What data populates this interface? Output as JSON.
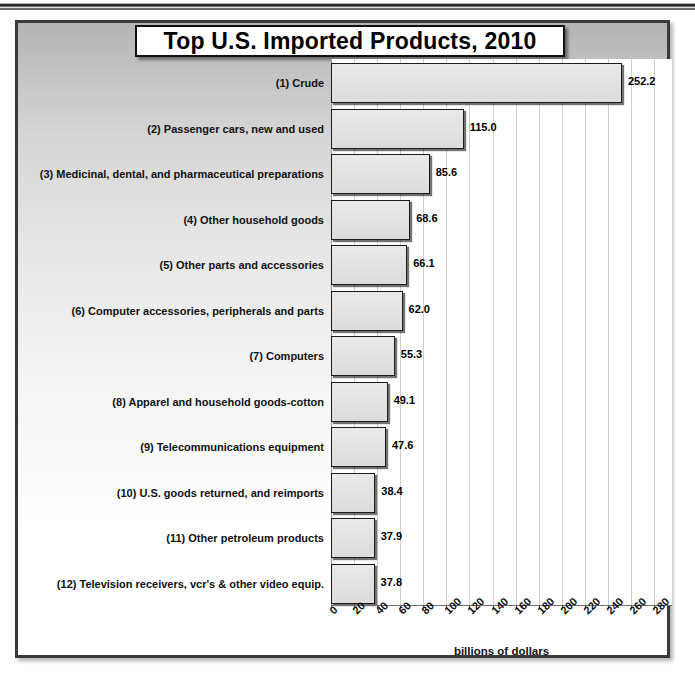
{
  "decor": {
    "top_rule_name": "page-header-rule"
  },
  "chart_data": {
    "type": "bar",
    "orientation": "horizontal",
    "title": "Top U.S. Imported Products, 2010",
    "xlabel": "billions of dollars",
    "ylabel": "",
    "xlim": [
      0,
      280
    ],
    "xticks": [
      0,
      20,
      40,
      60,
      80,
      100,
      120,
      140,
      160,
      180,
      200,
      220,
      240,
      260,
      280
    ],
    "xtick_labels": [
      "0",
      "20",
      "40",
      "60",
      "80",
      "100",
      "120",
      "140",
      "160",
      "180",
      "200",
      "220",
      "240",
      "260",
      "280"
    ],
    "grid": "vertical",
    "legend": "none",
    "categories": [
      "(1) Crude",
      "(2) Passenger cars, new and used",
      "(3) Medicinal, dental, and pharmaceutical preparations",
      "(4) Other household goods",
      "(5) Other parts and accessories",
      "(6) Computer accessories, peripherals and parts",
      "(7) Computers",
      "(8) Apparel and household goods-cotton",
      "(9) Telecommunications equipment",
      "(10) U.S. goods returned, and reimports",
      "(11) Other petroleum products",
      "(12) Television receivers, vcr's & other video equip."
    ],
    "values": [
      252.2,
      115.0,
      85.6,
      68.6,
      66.1,
      62.0,
      55.3,
      49.1,
      47.6,
      38.4,
      37.9,
      37.8
    ],
    "value_labels": [
      "252.2",
      "115.0",
      "85.6",
      "68.6",
      "66.1",
      "62.0",
      "55.3",
      "49.1",
      "47.6",
      "38.4",
      "37.9",
      "37.8"
    ],
    "colors": {
      "bar_fill": "#e2e2e2",
      "bar_border": "#1b1b1b",
      "gridline": "#cfcfcf",
      "plot_background": "#ffffff",
      "frame_border": "#3a3a3a",
      "text": "#111111"
    }
  }
}
